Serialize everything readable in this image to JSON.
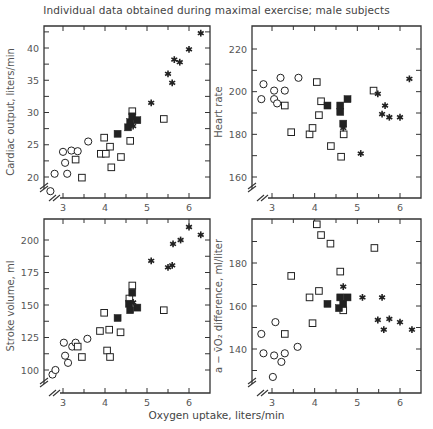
{
  "figure": {
    "title": "Individual data obtained during maximal exercise; male subjects",
    "xlabel": "Oxygen uptake, liters/min"
  },
  "chart_data": [
    {
      "type": "scatter",
      "panel": "top-left",
      "title": "",
      "xlabel": "Oxygen uptake, liters/min",
      "ylabel": "Cardiac output, liters/min",
      "xlim": [
        2.6,
        6.5
      ],
      "ylim": [
        17,
        43.5
      ],
      "xticks": [
        3,
        4,
        5,
        6
      ],
      "yticks": [
        20,
        25,
        30,
        35,
        40
      ],
      "axis_break": true,
      "grid": false,
      "series": [
        {
          "name": "open-circle",
          "marker": "circle-open",
          "points": [
            [
              2.7,
              17.8
            ],
            [
              2.8,
              20.5
            ],
            [
              3.0,
              23.9
            ],
            [
              3.05,
              22.2
            ],
            [
              3.1,
              20.5
            ],
            [
              3.2,
              24.1
            ],
            [
              3.35,
              24.0
            ],
            [
              3.6,
              25.5
            ]
          ]
        },
        {
          "name": "open-square",
          "marker": "square-open",
          "points": [
            [
              3.3,
              22.7
            ],
            [
              3.45,
              19.9
            ],
            [
              3.9,
              23.6
            ],
            [
              3.98,
              26.1
            ],
            [
              4.02,
              23.6
            ],
            [
              4.12,
              24.7
            ],
            [
              4.15,
              21.5
            ],
            [
              4.38,
              23.1
            ],
            [
              4.6,
              25.6
            ],
            [
              4.65,
              30.2
            ],
            [
              5.4,
              29.0
            ]
          ]
        },
        {
          "name": "filled-square",
          "marker": "square-filled",
          "points": [
            [
              4.3,
              26.7
            ],
            [
              4.55,
              27.7
            ],
            [
              4.6,
              28.5
            ],
            [
              4.65,
              29.4
            ],
            [
              4.77,
              28.8
            ]
          ]
        },
        {
          "name": "star",
          "marker": "star",
          "points": [
            [
              4.67,
              27.9
            ],
            [
              5.1,
              31.5
            ],
            [
              5.5,
              36.0
            ],
            [
              5.6,
              34.6
            ],
            [
              5.65,
              38.2
            ],
            [
              5.78,
              37.8
            ],
            [
              6.0,
              39.8
            ],
            [
              6.28,
              42.3
            ]
          ]
        }
      ]
    },
    {
      "type": "scatter",
      "panel": "top-right",
      "title": "",
      "xlabel": "Oxygen uptake, liters/min",
      "ylabel": "Heart rate",
      "xlim": [
        2.6,
        6.5
      ],
      "ylim": [
        151,
        230
      ],
      "xticks": [
        3,
        4,
        5,
        6
      ],
      "yticks": [
        160,
        180,
        200,
        220
      ],
      "axis_break": true,
      "grid": false,
      "series": [
        {
          "name": "open-circle",
          "marker": "circle-open",
          "points": [
            [
              2.75,
              196.5
            ],
            [
              2.8,
              203.5
            ],
            [
              3.05,
              200.5
            ],
            [
              3.05,
              196.5
            ],
            [
              3.12,
              194.5
            ],
            [
              3.2,
              206.5
            ],
            [
              3.3,
              200.5
            ],
            [
              3.62,
              206.5
            ]
          ]
        },
        {
          "name": "open-square",
          "marker": "square-open",
          "points": [
            [
              3.3,
              193.5
            ],
            [
              3.45,
              181.0
            ],
            [
              3.88,
              180.0
            ],
            [
              3.95,
              183.0
            ],
            [
              4.05,
              204.5
            ],
            [
              4.1,
              189.0
            ],
            [
              4.15,
              195.5
            ],
            [
              4.38,
              174.5
            ],
            [
              4.62,
              169.5
            ],
            [
              4.68,
              180.0
            ],
            [
              5.38,
              200.5
            ]
          ]
        },
        {
          "name": "filled-square",
          "marker": "square-filled",
          "points": [
            [
              4.3,
              193.5
            ],
            [
              4.6,
              193.5
            ],
            [
              4.6,
              190.5
            ],
            [
              4.67,
              185.0
            ],
            [
              4.77,
              196.5
            ]
          ]
        },
        {
          "name": "star",
          "marker": "star",
          "points": [
            [
              4.67,
              183.0
            ],
            [
              5.08,
              171.0
            ],
            [
              5.48,
              199.0
            ],
            [
              5.58,
              189.5
            ],
            [
              5.65,
              193.5
            ],
            [
              5.75,
              188.0
            ],
            [
              6.0,
              188.0
            ],
            [
              6.22,
              206.0
            ]
          ]
        }
      ]
    },
    {
      "type": "scatter",
      "panel": "bottom-left",
      "title": "",
      "xlabel": "Oxygen uptake, liters/min",
      "ylabel": "Stroke volume, ml",
      "xlim": [
        2.6,
        6.5
      ],
      "ylim": [
        83,
        212
      ],
      "xticks": [
        3,
        4,
        5,
        6
      ],
      "yticks": [
        100,
        125,
        150,
        175,
        200
      ],
      "axis_break": true,
      "grid": false,
      "series": [
        {
          "name": "open-circle",
          "marker": "circle-open",
          "points": [
            [
              2.75,
              96.5
            ],
            [
              2.82,
              100.0
            ],
            [
              3.02,
              121.0
            ],
            [
              3.05,
              111.0
            ],
            [
              3.12,
              105.5
            ],
            [
              3.22,
              118.0
            ],
            [
              3.3,
              121.0
            ],
            [
              3.58,
              124.0
            ]
          ]
        },
        {
          "name": "open-square",
          "marker": "square-open",
          "points": [
            [
              3.35,
              118.0
            ],
            [
              3.45,
              110.0
            ],
            [
              3.88,
              130.0
            ],
            [
              3.98,
              144.0
            ],
            [
              4.05,
              115.0
            ],
            [
              4.1,
              131.0
            ],
            [
              4.12,
              110.0
            ],
            [
              4.37,
              129.0
            ],
            [
              4.58,
              155.0
            ],
            [
              4.65,
              165.0
            ],
            [
              5.4,
              146.0
            ]
          ]
        },
        {
          "name": "filled-square",
          "marker": "square-filled",
          "points": [
            [
              4.3,
              140.0
            ],
            [
              4.57,
              151.0
            ],
            [
              4.6,
              146.0
            ],
            [
              4.65,
              159.5
            ],
            [
              4.77,
              148.0
            ]
          ]
        },
        {
          "name": "star",
          "marker": "star",
          "points": [
            [
              4.67,
              152.0
            ],
            [
              5.1,
              184.0
            ],
            [
              5.5,
              179.0
            ],
            [
              5.6,
              180.5
            ],
            [
              5.62,
              197.0
            ],
            [
              5.8,
              200.0
            ],
            [
              6.0,
              210.0
            ],
            [
              6.28,
              204.0
            ]
          ]
        }
      ]
    },
    {
      "type": "scatter",
      "panel": "bottom-right",
      "title": "",
      "xlabel": "Oxygen uptake, liters/min",
      "ylabel": "a − v̄O₂ difference, ml/liter",
      "xlim": [
        2.6,
        6.5
      ],
      "ylim": [
        122,
        198
      ],
      "xticks": [
        3,
        4,
        5,
        6
      ],
      "yticks": [
        140,
        160,
        180
      ],
      "axis_break": true,
      "grid": false,
      "series": [
        {
          "name": "open-circle",
          "marker": "circle-open",
          "points": [
            [
              2.75,
              147.0
            ],
            [
              2.8,
              138.0
            ],
            [
              3.02,
              127.0
            ],
            [
              3.05,
              137.0
            ],
            [
              3.08,
              152.5
            ],
            [
              3.22,
              134.0
            ],
            [
              3.3,
              138.0
            ],
            [
              3.6,
              141.0
            ]
          ]
        },
        {
          "name": "open-square",
          "marker": "square-open",
          "points": [
            [
              3.3,
              147.0
            ],
            [
              3.45,
              174.0
            ],
            [
              3.88,
              164.0
            ],
            [
              3.95,
              152.0
            ],
            [
              4.05,
              198.0
            ],
            [
              4.1,
              167.0
            ],
            [
              4.15,
              193.0
            ],
            [
              4.37,
              189.0
            ],
            [
              4.6,
              176.0
            ],
            [
              4.67,
              158.0
            ],
            [
              5.4,
              187.0
            ]
          ]
        },
        {
          "name": "filled-square",
          "marker": "square-filled",
          "points": [
            [
              4.3,
              161.0
            ],
            [
              4.57,
              159.0
            ],
            [
              4.6,
              164.0
            ],
            [
              4.67,
              161.0
            ],
            [
              4.77,
              164.0
            ]
          ]
        },
        {
          "name": "star",
          "marker": "star",
          "points": [
            [
              4.67,
              169.0
            ],
            [
              5.12,
              164.0
            ],
            [
              5.48,
              153.5
            ],
            [
              5.58,
              164.0
            ],
            [
              5.62,
              149.0
            ],
            [
              5.75,
              154.0
            ],
            [
              6.0,
              152.5
            ],
            [
              6.28,
              149.0
            ]
          ]
        }
      ]
    }
  ],
  "layout": {
    "panels": [
      {
        "x0": 44,
        "x1": 210,
        "y0": 26,
        "y1": 198,
        "xref": [
          [
            3,
            63
          ],
          [
            6,
            189
          ]
        ],
        "yref": [
          [
            20,
            177
          ],
          [
            40,
            48
          ]
        ],
        "ylabel_x": 22
      },
      {
        "x0": 252,
        "x1": 421,
        "y0": 26,
        "y1": 198,
        "xref": [
          [
            3,
            272
          ],
          [
            6,
            400
          ]
        ],
        "yref": [
          [
            160,
            177
          ],
          [
            220,
            49
          ]
        ],
        "ylabel_x": 230
      },
      {
        "x0": 44,
        "x1": 210,
        "y0": 219,
        "y1": 393,
        "xref": [
          [
            3,
            63
          ],
          [
            6,
            189
          ]
        ],
        "yref": [
          [
            100,
            370
          ],
          [
            200,
            240
          ]
        ],
        "ylabel_x": 22
      },
      {
        "x0": 252,
        "x1": 421,
        "y0": 219,
        "y1": 393,
        "xref": [
          [
            3,
            272
          ],
          [
            6,
            400
          ]
        ],
        "yref": [
          [
            140,
            349
          ],
          [
            180,
            263
          ]
        ],
        "ylabel_x": 230
      }
    ],
    "colors": {
      "axis": "#333333",
      "marker": "#222222",
      "text": "#555555"
    }
  }
}
